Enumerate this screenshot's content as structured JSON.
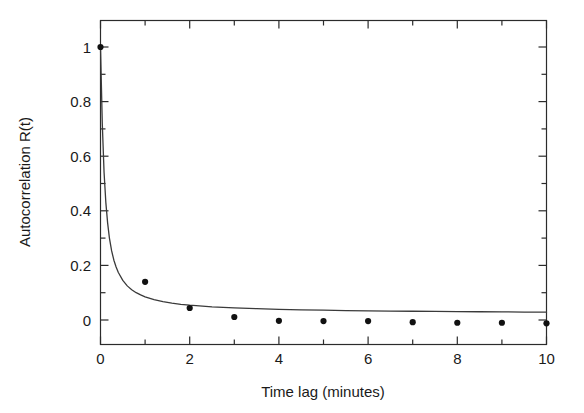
{
  "chart_data": {
    "type": "scatter",
    "title": "",
    "subtitle": "",
    "xlabel": "Time lag (minutes)",
    "ylabel": "Autocorrelation R(t)",
    "xlim": [
      0,
      10
    ],
    "ylim": [
      -0.08,
      1.09
    ],
    "xticks": [
      0,
      2,
      4,
      6,
      8,
      10
    ],
    "xtick_labels": [
      "0",
      "2",
      "4",
      "6",
      "8",
      "10"
    ],
    "xticks_minor": [
      1,
      3,
      5,
      7,
      9
    ],
    "yticks": [
      0,
      0.2,
      0.4,
      0.6,
      0.8,
      1
    ],
    "ytick_labels": [
      "0",
      "0.2",
      "0.4",
      "0.6",
      "0.8",
      "1"
    ],
    "grid": false,
    "legend": null,
    "annotations": [],
    "series": [
      {
        "name": "Observed autocorrelation",
        "type": "scatter",
        "marker": "filled-circle",
        "color": "#111111",
        "x": [
          0,
          1,
          2,
          3,
          4,
          5,
          6,
          7,
          8,
          9,
          10
        ],
        "values": [
          1.0,
          0.14,
          0.044,
          0.011,
          -0.003,
          -0.004,
          -0.004,
          -0.008,
          -0.01,
          -0.01,
          -0.012
        ]
      },
      {
        "name": "Fitted decay curve",
        "type": "line",
        "color": "#3a3a3a",
        "x": [
          0.0,
          0.04,
          0.08,
          0.12,
          0.16,
          0.2,
          0.25,
          0.3,
          0.35,
          0.4,
          0.5,
          0.6,
          0.7,
          0.8,
          0.9,
          1.0,
          1.2,
          1.4,
          1.6,
          1.8,
          2.0,
          2.5,
          3.0,
          3.5,
          4.0,
          4.5,
          5.0,
          5.5,
          6.0,
          6.5,
          7.0,
          7.5,
          8.0,
          8.5,
          9.0,
          9.5,
          10.0
        ],
        "values": [
          1.0,
          0.72,
          0.54,
          0.43,
          0.355,
          0.3,
          0.253,
          0.219,
          0.194,
          0.174,
          0.145,
          0.125,
          0.111,
          0.1,
          0.092,
          0.085,
          0.0745,
          0.0672,
          0.0618,
          0.0576,
          0.0542,
          0.0483,
          0.0443,
          0.0414,
          0.0392,
          0.0374,
          0.0359,
          0.0347,
          0.0337,
          0.0328,
          0.032,
          0.0313,
          0.0307,
          0.0302,
          0.0297,
          0.0292,
          0.0288
        ]
      }
    ]
  },
  "axes": {
    "x_axis_label": "Time lag (minutes)",
    "y_axis_label": "Autocorrelation R(t)"
  },
  "ticks": {
    "x": [
      "0",
      "2",
      "4",
      "6",
      "8",
      "10"
    ],
    "y": [
      "0",
      "0.2",
      "0.4",
      "0.6",
      "0.8",
      "1"
    ]
  },
  "colors": {
    "background": "#ffffff",
    "frame": "#2b2b2b",
    "marker": "#111111",
    "curve": "#3a3a3a",
    "text": "#1a1a1a"
  }
}
